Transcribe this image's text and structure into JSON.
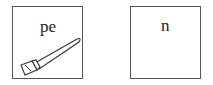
{
  "panels": [
    {
      "label": "pe",
      "icon": "pencil-icon"
    },
    {
      "label": "n"
    }
  ],
  "colors": {
    "stroke": "#555555",
    "text": "#222222",
    "background": "#ffffff"
  }
}
